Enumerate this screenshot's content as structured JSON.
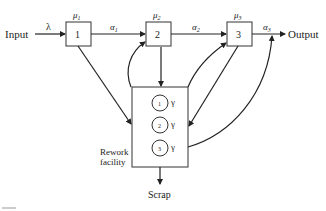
{
  "diagram": {
    "input_label": "Input",
    "output_label": "Output",
    "arrival_rate": "λ",
    "stations": [
      {
        "id": "1",
        "service_rate": "μ",
        "sub": "1",
        "out_prob": "α",
        "out_sub": "1"
      },
      {
        "id": "2",
        "service_rate": "μ",
        "sub": "2",
        "out_prob": "α",
        "out_sub": "2"
      },
      {
        "id": "3",
        "service_rate": "μ",
        "sub": "3",
        "out_prob": "α",
        "out_sub": "3"
      }
    ],
    "rework": {
      "label_line1": "Rework",
      "label_line2": "facility",
      "servers": [
        {
          "id": "1",
          "rate": "γ"
        },
        {
          "id": "2",
          "rate": "γ"
        },
        {
          "id": "3",
          "rate": "γ"
        }
      ]
    },
    "scrap_label": "Scrap"
  }
}
